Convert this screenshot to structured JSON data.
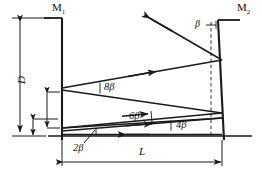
{
  "figure": {
    "kind": "optics-ray-diagram",
    "stroke_color": "#1a1a1a",
    "background_color": "#ffffff"
  },
  "labels": {
    "mirror_left": "M",
    "mirror_left_sub": "1",
    "mirror_right": "M",
    "mirror_right_sub": "2",
    "separation": "D",
    "length": "L",
    "tilt_angle": "β",
    "angle_2beta": "2β",
    "angle_4beta": "4β",
    "angle_6beta": "6β",
    "angle_8beta": "8β"
  },
  "geometry": {
    "mirror_left_x": 62,
    "mirror_right_x": 222,
    "baseline_y": 136,
    "top_y": 18,
    "dimension_L_y": 158,
    "dimension_D_x": 20
  }
}
